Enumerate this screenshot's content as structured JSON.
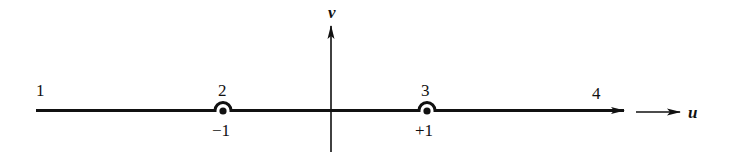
{
  "diagram": {
    "axes": {
      "horizontal_label": "u",
      "vertical_label": "v"
    },
    "region_labels": [
      {
        "id": "1",
        "text": "1"
      },
      {
        "id": "2",
        "text": "2"
      },
      {
        "id": "3",
        "text": "3"
      },
      {
        "id": "4",
        "text": "4"
      }
    ],
    "tick_labels": [
      {
        "text": "−1",
        "value": -1
      },
      {
        "text": "+1",
        "value": 1
      }
    ],
    "indentations": [
      {
        "at": -1,
        "type": "small semicircle above pole"
      },
      {
        "at": 1,
        "type": "small semicircle above pole"
      }
    ],
    "colors": {
      "stroke": "#111111",
      "background": "#ffffff"
    }
  }
}
